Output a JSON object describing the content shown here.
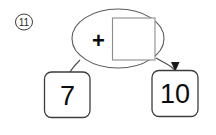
{
  "problem": {
    "number_label": "11",
    "marker_icon": "circled-number-icon"
  },
  "diagram": {
    "type": "part-part-whole-bond",
    "operation_bubble": {
      "operator": "+",
      "operator_icon": "plus-icon",
      "answer_blank": {
        "value": "",
        "placeholder": "",
        "shape": "square-blank"
      }
    },
    "addend_box": {
      "value": "7",
      "shape": "rounded-square"
    },
    "total_box": {
      "value": "10",
      "shape": "rounded-square"
    },
    "connector_left": {
      "icon": "curved-line",
      "has_arrowhead": "no"
    },
    "connector_right": {
      "icon": "curved-arrow",
      "has_arrowhead": "yes"
    }
  },
  "colors": {
    "background": "#ffffff",
    "ink": "#0d0d0d",
    "line": "#4a4a4a",
    "blank_outline": "#8c8c8c"
  }
}
